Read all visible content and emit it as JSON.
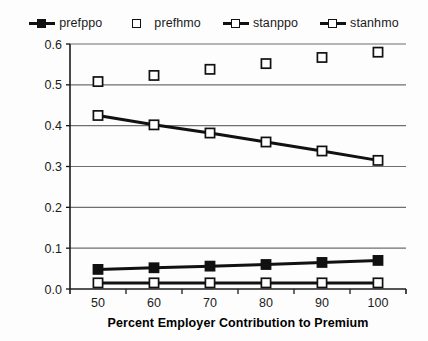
{
  "chart_data": {
    "type": "line",
    "title": "",
    "xlabel": "Percent Employer Contribution to Premium",
    "ylabel": "Predicted Probability",
    "x": [
      50,
      60,
      70,
      80,
      90,
      100
    ],
    "categories": [
      "50",
      "60",
      "70",
      "80",
      "90",
      "100"
    ],
    "xlim": [
      45,
      105
    ],
    "ylim": [
      0.0,
      0.6
    ],
    "yticks": [
      "0.0",
      "0.1",
      "0.2",
      "0.3",
      "0.4",
      "0.5",
      "0.6"
    ],
    "ytick_values": [
      0.0,
      0.1,
      0.2,
      0.3,
      0.4,
      0.5,
      0.6
    ],
    "xticks": [
      "50",
      "60",
      "70",
      "80",
      "90",
      "100"
    ],
    "grid": "horizontal",
    "legend_position": "top-center",
    "series": [
      {
        "name": "prefppo",
        "values": [
          0.048,
          0.052,
          0.056,
          0.06,
          0.065,
          0.07
        ],
        "marker": "filled-square",
        "line": true,
        "color": "#111111"
      },
      {
        "name": "prefhmo",
        "values": [
          0.508,
          0.523,
          0.538,
          0.552,
          0.567,
          0.58
        ],
        "marker": "open-square",
        "line": false,
        "color": "#111111"
      },
      {
        "name": "stanppo",
        "values": [
          0.425,
          0.402,
          0.382,
          0.36,
          0.338,
          0.315
        ],
        "marker": "open-square",
        "line": true,
        "color": "#111111"
      },
      {
        "name": "stanhmo",
        "values": [
          0.015,
          0.015,
          0.015,
          0.015,
          0.015,
          0.015
        ],
        "marker": "open-square",
        "line": true,
        "color": "#111111"
      }
    ]
  },
  "legend": {
    "items": [
      {
        "label": "prefppo",
        "marker": "filled-square",
        "has_line": true
      },
      {
        "label": "prefhmo",
        "marker": "open-square",
        "has_line": false
      },
      {
        "label": "stanppo",
        "marker": "open-square",
        "has_line": true
      },
      {
        "label": "stanhmo",
        "marker": "open-square",
        "has_line": true
      }
    ]
  },
  "colors": {
    "ink": "#111111",
    "grid": "#6f6f6f",
    "axis": "#1b1b1b",
    "background": "#fdfdfd"
  }
}
